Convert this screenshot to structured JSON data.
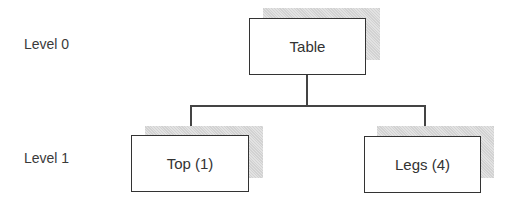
{
  "levels": [
    {
      "label": "Level 0"
    },
    {
      "label": "Level 1"
    }
  ],
  "nodes": {
    "root": {
      "label": "Table"
    },
    "children": [
      {
        "label": "Top (1)"
      },
      {
        "label": "Legs (4)"
      }
    ]
  }
}
